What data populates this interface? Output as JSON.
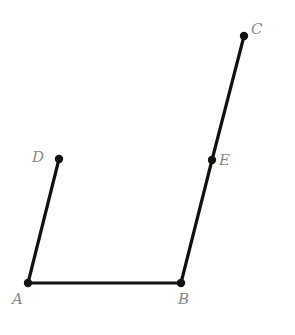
{
  "diagram": {
    "type": "geometry-figure",
    "points": [
      {
        "id": "A",
        "label": "A",
        "x": 28,
        "y": 283,
        "label_x": 12,
        "label_y": 292
      },
      {
        "id": "B",
        "label": "B",
        "x": 181,
        "y": 283,
        "label_x": 178,
        "label_y": 292
      },
      {
        "id": "C",
        "label": "C",
        "x": 244,
        "y": 36,
        "label_x": 251,
        "label_y": 22
      },
      {
        "id": "D",
        "label": "D",
        "x": 59,
        "y": 159,
        "label_x": 32,
        "label_y": 150
      },
      {
        "id": "E",
        "label": "E",
        "x": 212,
        "y": 160,
        "label_x": 219,
        "label_y": 153
      }
    ],
    "segments": [
      {
        "id": "AB",
        "from": "A",
        "to": "B"
      },
      {
        "id": "AD",
        "from": "A",
        "to": "D"
      },
      {
        "id": "BE",
        "from": "B",
        "to": "E"
      },
      {
        "id": "EC",
        "from": "E",
        "to": "C"
      }
    ],
    "colors": {
      "line": "#111111",
      "point": "#111111",
      "label": "#8a8a8a",
      "background": "#ffffff"
    }
  }
}
